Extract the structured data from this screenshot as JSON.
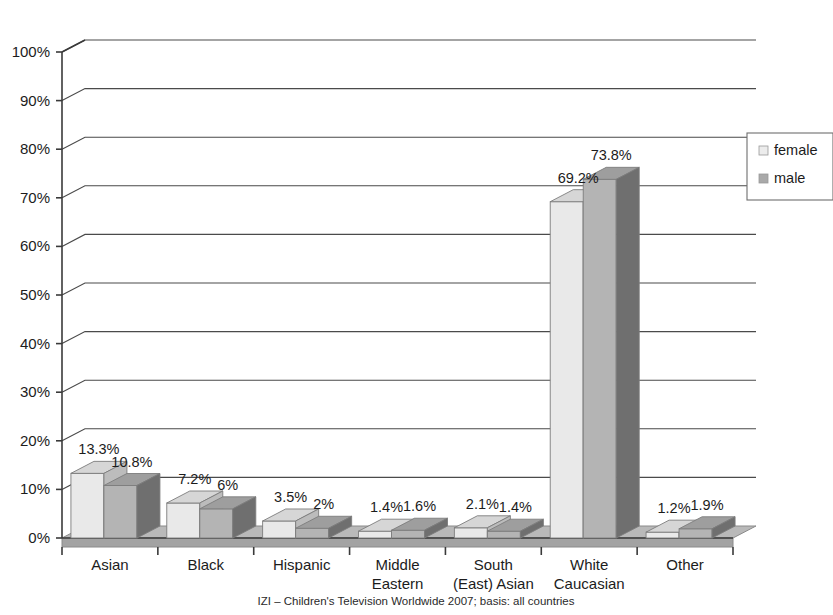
{
  "chart_data": {
    "type": "bar",
    "title": "",
    "subtitle": "",
    "xlabel": "",
    "ylabel": "",
    "ylim": [
      0,
      100
    ],
    "ytick_labels": [
      "0%",
      "10%",
      "20%",
      "30%",
      "40%",
      "50%",
      "60%",
      "70%",
      "80%",
      "90%",
      "100%"
    ],
    "ytick_values": [
      0,
      10,
      20,
      30,
      40,
      50,
      60,
      70,
      80,
      90,
      100
    ],
    "grid": true,
    "style": "3d-clustered-column",
    "legend_position": "right",
    "categories": [
      "Asian",
      "Black",
      "Hispanic",
      "Middle Eastern",
      "South (East) Asian",
      "White Caucasian",
      "Other"
    ],
    "category_lines": [
      [
        "Asian"
      ],
      [
        "Black"
      ],
      [
        "Hispanic"
      ],
      [
        "Middle",
        "Eastern"
      ],
      [
        "South",
        "(East) Asian"
      ],
      [
        "White",
        "Caucasian"
      ],
      [
        "Other"
      ]
    ],
    "series": [
      {
        "name": "female",
        "color": "#e9e9e9",
        "top_color": "#d6d6d6",
        "side_color": "#bcbcbc",
        "values": [
          13.3,
          7.2,
          3.5,
          1.4,
          2.1,
          69.2,
          1.2
        ],
        "labels": [
          "13.3%",
          "7.2%",
          "3.5%",
          "1.4%",
          "2.1%",
          "69.2%",
          "1.2%"
        ]
      },
      {
        "name": "male",
        "color": "#b4b4b4",
        "top_color": "#9e9e9e",
        "side_color": "#6f6f6f",
        "values": [
          10.8,
          6.0,
          2.0,
          1.6,
          1.4,
          73.8,
          1.9
        ],
        "labels": [
          "10.8%",
          "6%",
          "2%",
          "1.6%",
          "1.4%",
          "73.8%",
          "1.9%"
        ]
      }
    ],
    "annotations": {
      "caption": "IZI – Children's Television Worldwide 2007; basis: all countries"
    }
  },
  "legend": {
    "items": [
      {
        "label": "female",
        "swatch": "#ececec"
      },
      {
        "label": "male",
        "swatch": "#a9a9a9"
      }
    ]
  },
  "colors": {
    "axis": "#3a3a3a",
    "grid": "#4a4a4a",
    "floor": "#b9b9b9",
    "floor_front": "#a3a3a3",
    "text": "#1c1c1c",
    "background": "#ffffff"
  }
}
